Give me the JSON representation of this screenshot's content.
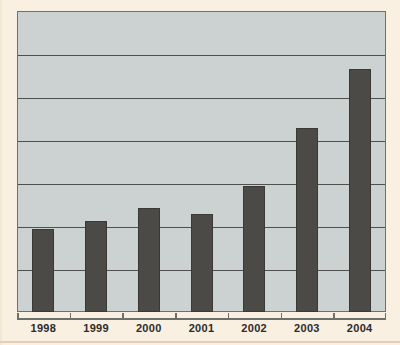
{
  "chart_data": {
    "type": "bar",
    "title": "",
    "subtitle": "",
    "xlabel": "",
    "ylabel": "",
    "categories": [
      "1998",
      "1999",
      "2000",
      "2001",
      "2002",
      "2003",
      "2004"
    ],
    "values": [
      1.94,
      2.11,
      2.43,
      2.29,
      2.94,
      4.28,
      5.65
    ],
    "series": [
      {
        "name": "",
        "values": [
          1.94,
          2.11,
          2.43,
          2.29,
          2.94,
          4.28,
          5.65
        ]
      }
    ],
    "ylim": [
      0,
      7
    ],
    "y_tick_values": [
      1,
      2,
      3,
      4,
      5,
      6
    ],
    "y_tick_labels": [],
    "x_tick_labels": [
      "1998",
      "1999",
      "2000",
      "2001",
      "2002",
      "2003",
      "2004"
    ],
    "grid": true,
    "grid_axis": "y",
    "gridline_count": 6,
    "legend": [],
    "legend_position": "none",
    "annotations": [],
    "bar_count": 7,
    "colors": {
      "bar_fill": "#4b4a47",
      "bar_edge": "#3a3936",
      "plot_background": "#ccd2d2",
      "page_background": "#faf0e2",
      "gridline": "#4f504d",
      "frame_border": "#6f706c",
      "axis_label_text": "#2b2b2b"
    }
  }
}
